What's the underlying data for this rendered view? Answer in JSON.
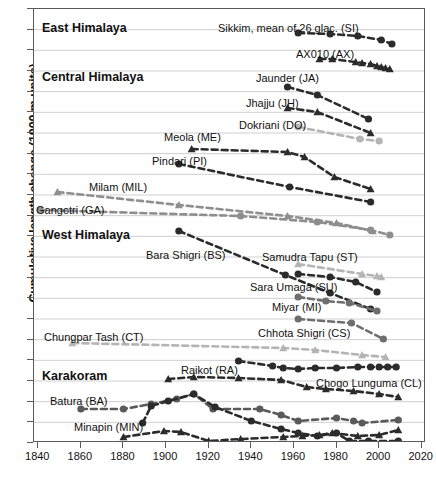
{
  "axes": {
    "ylabel": "Cumulative length change (1000 m units)",
    "xticks": [
      1840,
      1860,
      1880,
      1900,
      1920,
      1940,
      1960,
      1980,
      2000,
      2020
    ],
    "xlim": [
      1838,
      2022
    ],
    "ylim": [
      0,
      434
    ],
    "n_gridlines": 21
  },
  "regions": [
    {
      "name": "east-himalaya",
      "label": "East Himalaya",
      "x": 8,
      "y": 12
    },
    {
      "name": "central-himalaya",
      "label": "Central Himalaya",
      "x": 8,
      "y": 61
    },
    {
      "name": "west-himalaya",
      "label": "West Himalaya",
      "x": 8,
      "y": 219
    },
    {
      "name": "karakoram",
      "label": "Karakoram",
      "x": 8,
      "y": 360
    }
  ],
  "chart_data": {
    "type": "line",
    "title": "",
    "xlabel": "",
    "ylabel": "Cumulative length change (1000 m units)",
    "xlim": [
      1838,
      2022
    ],
    "grid": true,
    "legend": "inline-labels",
    "series": [
      {
        "name": "Sikkim, mean of 26 glac. (SI)",
        "code": "SI",
        "region": "East Himalaya",
        "marker": "circle",
        "color": "#2b2b2b",
        "label_x": 184,
        "label_y": 13,
        "label_align": "left",
        "x": [
          1962,
          1977,
          1990,
          2001,
          2006
        ],
        "y": [
          24,
          25,
          27,
          31,
          35
        ]
      },
      {
        "name": "AX010 (AX)",
        "code": "AX",
        "region": "East Himalaya",
        "marker": "triangle",
        "color": "#2b2b2b",
        "label_x": 262,
        "label_y": 39,
        "label_align": "left",
        "x": [
          1972,
          1978,
          1989,
          1992,
          1996,
          1999,
          2001,
          2003,
          2005
        ],
        "y": [
          50,
          50,
          53,
          54,
          55,
          57,
          58,
          59,
          60
        ]
      },
      {
        "name": "Jaunder (JA)",
        "code": "JA",
        "region": "Central Himalaya",
        "marker": "circle",
        "color": "#2b2b2b",
        "label_x": 222,
        "label_y": 63,
        "label_align": "left",
        "x": [
          1957,
          1971,
          1995
        ],
        "y": [
          78,
          86,
          110
        ]
      },
      {
        "name": "Jhajju (JH)",
        "code": "JH",
        "region": "Central Himalaya",
        "marker": "triangle",
        "color": "#2b2b2b",
        "label_x": 212,
        "label_y": 88,
        "label_align": "left",
        "x": [
          1957,
          1971,
          1996
        ],
        "y": [
          99,
          103,
          124
        ]
      },
      {
        "name": "Dokriani (DO)",
        "code": "DO",
        "region": "Central Himalaya",
        "marker": "circle",
        "color": "#b4b4b4",
        "label_x": 205,
        "label_y": 110,
        "label_align": "left",
        "x": [
          1962,
          1991,
          2000
        ],
        "y": [
          118,
          130,
          132
        ]
      },
      {
        "name": "Meola (ME)",
        "code": "ME",
        "region": "Central Himalaya",
        "marker": "triangle",
        "color": "#2b2b2b",
        "label_x": 130,
        "label_y": 122,
        "label_align": "left",
        "x": [
          1912,
          1957,
          1965,
          1979,
          1996
        ],
        "y": [
          140,
          143,
          148,
          168,
          180
        ]
      },
      {
        "name": "Pindari (PI)",
        "code": "PI",
        "region": "Central Himalaya",
        "marker": "circle",
        "color": "#2b2b2b",
        "label_x": 118,
        "label_y": 146,
        "label_align": "left",
        "x": [
          1906,
          1958,
          1996
        ],
        "y": [
          155,
          178,
          193
        ]
      },
      {
        "name": "Milam (MIL)",
        "code": "MIL",
        "region": "Central Himalaya",
        "marker": "triangle",
        "color": "#8e8e8e",
        "label_x": 55,
        "label_y": 172,
        "label_align": "left",
        "x": [
          1849,
          1906,
          1957,
          1980,
          1997
        ],
        "y": [
          183,
          196,
          207,
          214,
          222
        ]
      },
      {
        "name": "Gangotri (GA)",
        "code": "GA",
        "region": "Central Himalaya",
        "marker": "circle",
        "color": "#8e8e8e",
        "label_x": 2,
        "label_y": 195,
        "label_align": "left",
        "x": [
          1841,
          1935,
          1971,
          1996,
          2005
        ],
        "y": [
          201,
          207,
          213,
          221,
          226
        ]
      },
      {
        "name": "Bara Shigri (BS)",
        "code": "BS",
        "region": "West Himalaya",
        "marker": "circle",
        "color": "#2b2b2b",
        "label_x": 112,
        "label_y": 240,
        "label_align": "left",
        "x": [
          1906,
          1956,
          1977,
          1996
        ],
        "y": [
          222,
          266,
          284,
          300
        ]
      },
      {
        "name": "Samudra Tapu (ST)",
        "code": "ST",
        "region": "West Himalaya",
        "marker": "triangle",
        "color": "#b4b4b4",
        "label_x": 228,
        "label_y": 242,
        "label_align": "left",
        "x": [
          1962,
          1992,
          1999,
          2001
        ],
        "y": [
          255,
          265,
          267,
          268
        ]
      },
      {
        "name": "Sara Umaga (SU)",
        "code": "SU",
        "region": "West Himalaya",
        "marker": "circle",
        "color": "#2b2b2b",
        "label_x": 216,
        "label_y": 272,
        "label_align": "left",
        "x": [
          1962,
          1977,
          1989,
          1999
        ],
        "y": [
          265,
          268,
          273,
          283
        ]
      },
      {
        "name": "Miyar (MI)",
        "code": "MI",
        "region": "West Himalaya",
        "marker": "circle",
        "color": "#6e6e6e",
        "label_x": 238,
        "label_y": 292,
        "label_align": "left",
        "x": [
          1962,
          1975,
          1986,
          1999
        ],
        "y": [
          288,
          292,
          294,
          302
        ]
      },
      {
        "name": "Chhota Shigri (CS)",
        "code": "CS",
        "region": "West Himalaya",
        "marker": "circle",
        "color": "#6e6e6e",
        "label_x": 224,
        "label_y": 318,
        "label_align": "left",
        "x": [
          1962,
          1987,
          2002
        ],
        "y": [
          310,
          314,
          330
        ]
      },
      {
        "name": "Chungpar Tash (CT)",
        "code": "CT",
        "region": "West Himalaya",
        "marker": "triangle",
        "color": "#b4b4b4",
        "label_x": 10,
        "label_y": 322,
        "label_align": "left",
        "x": [
          1856,
          1955,
          1970,
          1992,
          2003
        ],
        "y": [
          334,
          339,
          341,
          346,
          348
        ]
      },
      {
        "name": "Raikot (RA)",
        "code": "RA",
        "region": "Karakoram",
        "marker": "circle",
        "color": "#2b2b2b",
        "label_x": 147,
        "label_y": 355,
        "label_align": "left",
        "x": [
          1934,
          1950,
          1955,
          1962,
          1970,
          1980,
          1990,
          1996,
          2000,
          2004,
          2008
        ],
        "y": [
          352,
          357,
          359,
          360,
          359,
          359,
          358,
          358,
          358,
          358,
          358
        ]
      },
      {
        "name": "Chogo Lunguma (CL)",
        "code": "CL",
        "region": "Karakoram",
        "marker": "triangle",
        "color": "#2b2b2b",
        "label_x": 282,
        "label_y": 368,
        "label_align": "left",
        "x": [
          1901,
          1913,
          1934,
          1954,
          1966,
          1975,
          1988,
          2000,
          2009
        ],
        "y": [
          370,
          368,
          369,
          371,
          378,
          380,
          382,
          385,
          388
        ]
      },
      {
        "name": "Batura (BA)",
        "code": "BA",
        "region": "Karakoram",
        "marker": "circle",
        "color": "#5a5a5a",
        "label_x": 16,
        "label_y": 386,
        "label_align": "left",
        "x": [
          1860,
          1880,
          1893,
          1905,
          1913,
          1922,
          1944,
          1954,
          1962,
          1980,
          1988,
          1992,
          2009
        ],
        "y": [
          400,
          400,
          395,
          390,
          385,
          400,
          400,
          406,
          412,
          409,
          412,
          414,
          411
        ]
      },
      {
        "name": "Minapin (MIN)",
        "code": "MIN",
        "region": "Karakoram",
        "marker": "circle",
        "color": "#2b2b2b",
        "label_x": 40,
        "label_y": 412,
        "label_align": "left",
        "x": [
          1889,
          1893,
          1901,
          1913,
          1923,
          1940,
          1954,
          1962,
          1971,
          1980,
          1986,
          1995,
          2009
        ],
        "y": [
          414,
          397,
          392,
          385,
          398,
          412,
          420,
          424,
          427,
          424,
          432,
          432,
          432
        ]
      },
      {
        "name": "Ghulkin (GU)",
        "code": "GU",
        "region": "Karakoram",
        "marker": "triangle",
        "color": "#2b2b2b",
        "label_x": 22,
        "label_y": 440,
        "label_align": "left",
        "x": [
          1880,
          1899,
          1907,
          1920,
          1935,
          1955,
          1964,
          1972,
          1978,
          1990,
          2000,
          2009
        ],
        "y": [
          428,
          422,
          423,
          432,
          430,
          428,
          427,
          426,
          424,
          427,
          426,
          421
        ]
      }
    ]
  }
}
